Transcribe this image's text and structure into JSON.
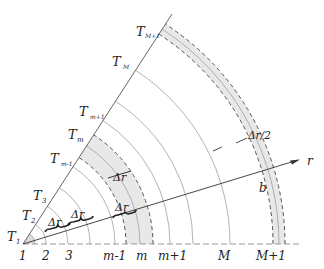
{
  "diagram": {
    "type": "polar-grid-sector",
    "origin_label": "1",
    "axis_label": "r",
    "point_label": "b",
    "node_labels_bottom": [
      "1",
      "2",
      "3",
      "m-1",
      "m",
      "m+1",
      "M",
      "M+1"
    ],
    "boundary_labels": [
      {
        "main": "T",
        "sub": "1"
      },
      {
        "main": "T",
        "sub": "2"
      },
      {
        "main": "T",
        "sub": "3"
      },
      {
        "main": "T",
        "sub": "m-1"
      },
      {
        "main": "T",
        "sub": "m"
      },
      {
        "main": "T",
        "sub": "m+1"
      },
      {
        "main": "T",
        "sub": "M"
      },
      {
        "main": "T",
        "sub": "M+1"
      }
    ],
    "annotations": {
      "delta_r_1": "Δr",
      "delta_r_2": "Δr",
      "delta_r_3": "Δr",
      "delta_r_4": "Δr",
      "half_delta_r": "Δr/2"
    },
    "colors": {
      "line": "#333333",
      "arc": "#9a9a9a",
      "shade": "#e6e6e6",
      "dash": "#444444"
    }
  }
}
